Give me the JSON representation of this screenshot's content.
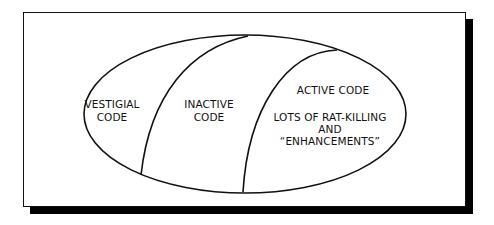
{
  "diagram": {
    "type": "venn-like-ellipse-partition",
    "regions": [
      {
        "id": "vestigial",
        "lines": [
          "VESTIGIAL",
          "CODE"
        ]
      },
      {
        "id": "inactive",
        "lines": [
          "INACTIVE",
          "CODE"
        ]
      },
      {
        "id": "active",
        "lines": [
          "ACTIVE CODE",
          "",
          "LOTS OF RAT-KILLING",
          "AND",
          "“ENHANCEMENTS”"
        ]
      }
    ],
    "labels": {
      "vestigial_1": "VESTIGIAL",
      "vestigial_2": "CODE",
      "inactive_1": "INACTIVE",
      "inactive_2": "CODE",
      "active_title": "ACTIVE CODE",
      "active_1": "LOTS OF RAT-KILLING",
      "active_2": "AND",
      "active_3": "“ENHANCEMENTS”"
    },
    "colors": {
      "stroke": "#111111",
      "background": "#ffffff",
      "shadow": "#000000"
    }
  }
}
